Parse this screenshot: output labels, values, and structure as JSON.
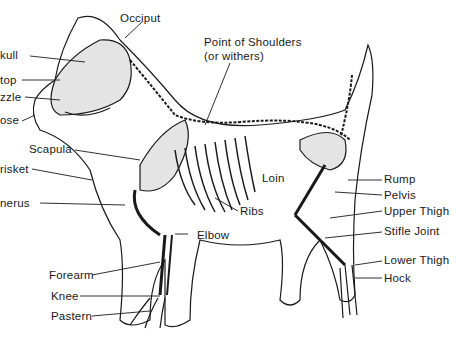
{
  "diagram": {
    "labels": {
      "occiput": "Occiput",
      "skull": "kull",
      "stop": "top",
      "muzzle": "zzle",
      "nose": "ose",
      "point_of_shoulders": "Point of Shoulders",
      "withers": "(or withers)",
      "scapula": "Scapula",
      "brisket": "risket",
      "humerus": "nerus",
      "ribs": "Ribs",
      "loin": "Loin",
      "elbow": "Elbow",
      "forearm": "Forearm",
      "knee": "Knee",
      "pastern": "Pastern",
      "rump": "Rump",
      "pelvis": "Pelvis",
      "upper_thigh": "Upper Thigh",
      "stifle_joint": "Stifle Joint",
      "lower_thigh": "Lower Thigh",
      "hock": "Hock"
    },
    "colors": {
      "line": "#1a1a1a",
      "background": "#ffffff",
      "bone_shade": "#d8d8d8"
    }
  }
}
